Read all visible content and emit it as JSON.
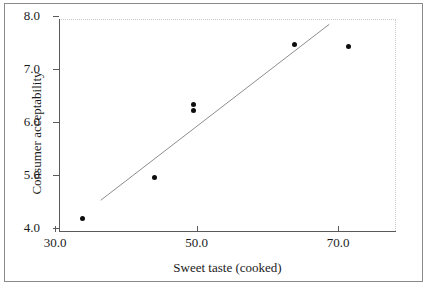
{
  "chart_data": {
    "type": "scatter",
    "title": "",
    "xlabel": "Sweet taste (cooked)",
    "ylabel": "Consumer acceptability",
    "xlim": [
      30.0,
      70.0
    ],
    "ylim": [
      4.0,
      8.0
    ],
    "xticks": [
      "30.0",
      "50.0",
      "70.0"
    ],
    "xtick_values": [
      30.0,
      50.0,
      70.0
    ],
    "yticks": [
      "4.0",
      "5.0",
      "6.0",
      "7.0",
      "8.0"
    ],
    "ytick_values": [
      4.0,
      5.0,
      6.0,
      7.0,
      8.0
    ],
    "grid": false,
    "legend": "none",
    "points": [
      {
        "x": 33.9,
        "y": 4.17
      },
      {
        "x": 44.1,
        "y": 4.96
      },
      {
        "x": 49.6,
        "y": 6.33
      },
      {
        "x": 49.6,
        "y": 6.22
      },
      {
        "x": 63.9,
        "y": 7.47
      },
      {
        "x": 71.5,
        "y": 7.42
      }
    ],
    "series": [
      {
        "name": "Consumer acceptability",
        "x": [
          33.9,
          44.1,
          49.6,
          49.6,
          63.9,
          71.5
        ],
        "values": [
          4.17,
          4.96,
          6.33,
          6.22,
          7.47,
          7.42
        ]
      }
    ],
    "trendline": {
      "type": "linear",
      "x_start": 35.9,
      "y_start": 4.58,
      "x_end": 68.2,
      "y_end": 7.9
    },
    "marker": {
      "shape": "circle",
      "color": "#0d0d0d",
      "size": 5
    },
    "trendline_color": "#8d8d8d",
    "axis_color": "#5a5a5a",
    "frame_color": "#8a8a8a",
    "plot_edge_color": "#c9c9c9",
    "background": "#ffffff"
  }
}
